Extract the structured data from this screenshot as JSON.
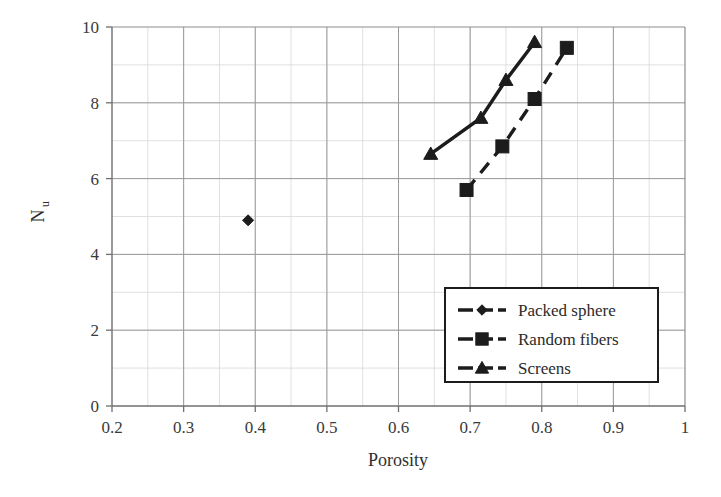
{
  "chart_data": {
    "type": "scatter",
    "title": "",
    "xlabel": "Porosity",
    "ylabel": "Nu",
    "ylabel_base": "N",
    "ylabel_sub": "u",
    "xlim": [
      0.2,
      1
    ],
    "ylim": [
      0,
      10
    ],
    "xticks": [
      "0.2",
      "0.3",
      "0.4",
      "0.5",
      "0.6",
      "0.7",
      "0.8",
      "0.9",
      "1"
    ],
    "xtick_values": [
      0.2,
      0.3,
      0.4,
      0.5,
      0.6,
      0.7,
      0.8,
      0.9,
      1
    ],
    "yticks": [
      "0",
      "2",
      "4",
      "6",
      "8",
      "10"
    ],
    "ytick_values": [
      0,
      2,
      4,
      6,
      8,
      10
    ],
    "minor_y_step": 1,
    "minor_x_step": 0.05,
    "grid": true,
    "legend_position": "lower-right",
    "series": [
      {
        "name": "Packed sphere",
        "marker": "diamond",
        "line": "none",
        "color": "#1c1c1c",
        "x": [
          0.39
        ],
        "y": [
          4.9
        ]
      },
      {
        "name": "Random fibers",
        "marker": "square",
        "line": "dashed",
        "color": "#1c1c1c",
        "x": [
          0.695,
          0.745,
          0.79,
          0.835
        ],
        "y": [
          5.7,
          6.85,
          8.1,
          9.45
        ]
      },
      {
        "name": "Screens",
        "marker": "triangle",
        "line": "solid",
        "color": "#1c1c1c",
        "x": [
          0.645,
          0.715,
          0.75,
          0.79
        ],
        "y": [
          6.65,
          7.6,
          8.6,
          9.6
        ]
      }
    ]
  },
  "legend": {
    "items": [
      {
        "label": "Packed sphere",
        "marker": "diamond",
        "line": "dashed"
      },
      {
        "label": "Random fibers",
        "marker": "square",
        "line": "dashed"
      },
      {
        "label": "Screens",
        "marker": "triangle",
        "line": "dashed"
      }
    ]
  },
  "axes": {
    "x_title": "Porosity",
    "y_title_base": "N",
    "y_title_sub": "u"
  }
}
